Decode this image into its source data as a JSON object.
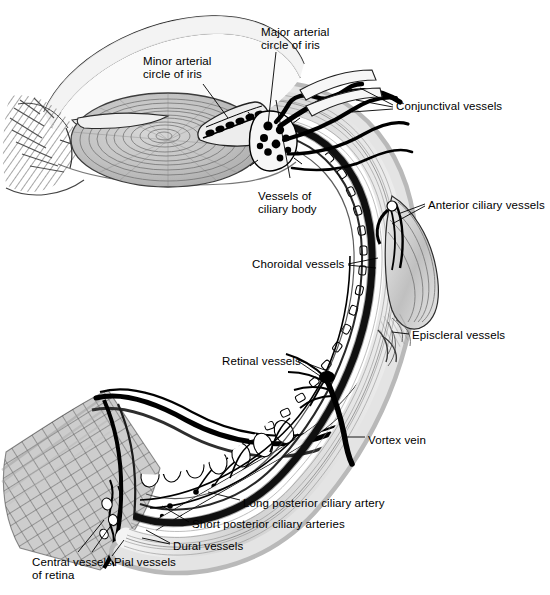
{
  "figure": {
    "type": "anatomical-diagram",
    "background_color": "#ffffff",
    "ink_color": "#000000",
    "width": 550,
    "height": 595
  },
  "labels": [
    {
      "id": "minor-arterial-circle-of-iris",
      "text": "Minor arterial\ncircle of iris",
      "x": 143,
      "y": 55,
      "align": "left"
    },
    {
      "id": "major-arterial-circle-of-iris",
      "text": "Major arterial\ncircle of iris",
      "x": 261,
      "y": 26,
      "align": "left"
    },
    {
      "id": "conjunctival-vessels",
      "text": "Conjunctival vessels",
      "x": 396,
      "y": 100,
      "align": "left"
    },
    {
      "id": "anterior-ciliary-vessels",
      "text": "Anterior ciliary vessels",
      "x": 428,
      "y": 199,
      "align": "left"
    },
    {
      "id": "vessels-of-ciliary-body",
      "text": "Vessels of\nciliary body",
      "x": 258,
      "y": 190,
      "align": "left"
    },
    {
      "id": "choroidal-vessels",
      "text": "Choroidal vessels",
      "x": 252,
      "y": 258,
      "align": "left"
    },
    {
      "id": "episcleral-vessels",
      "text": "Episcleral vessels",
      "x": 412,
      "y": 329,
      "align": "left"
    },
    {
      "id": "retinal-vessels",
      "text": "Retinal vessels",
      "x": 222,
      "y": 355,
      "align": "left"
    },
    {
      "id": "vortex-vein",
      "text": "Vortex vein",
      "x": 368,
      "y": 434,
      "align": "left"
    },
    {
      "id": "long-posterior-ciliary-artery",
      "text": "Long posterior ciliary artery",
      "x": 243,
      "y": 497,
      "align": "left"
    },
    {
      "id": "short-posterior-ciliary-arteries",
      "text": "Short posterior ciliary arteries",
      "x": 192,
      "y": 518,
      "align": "left"
    },
    {
      "id": "dural-vessels",
      "text": "Dural vessels",
      "x": 173,
      "y": 540,
      "align": "left"
    },
    {
      "id": "pial-vessels",
      "text": "Pial vessels",
      "x": 114,
      "y": 556,
      "align": "left"
    },
    {
      "id": "central-vessels-of-retina",
      "text": "Central vessels\nof retina",
      "x": 32,
      "y": 556,
      "align": "left"
    }
  ],
  "structures": [
    {
      "id": "cornea",
      "name": "Cornea"
    },
    {
      "id": "lens",
      "name": "Lens"
    },
    {
      "id": "iris",
      "name": "Iris"
    },
    {
      "id": "ciliary-body",
      "name": "Ciliary body"
    },
    {
      "id": "sclera",
      "name": "Sclera"
    },
    {
      "id": "choroid",
      "name": "Choroid"
    },
    {
      "id": "retina",
      "name": "Retina"
    },
    {
      "id": "optic-nerve",
      "name": "Optic nerve"
    },
    {
      "id": "extraocular-muscle-tendon",
      "name": "Extraocular muscle tendon"
    },
    {
      "id": "vitreous-chamber",
      "name": "Vitreous chamber"
    }
  ],
  "palette": {
    "ink": "#000000",
    "white": "#ffffff",
    "pale_grey": "#e9e9e9",
    "light_grey": "#d4d4d4",
    "mid_grey": "#b0b0b0",
    "dark_grey": "#757575",
    "deep_grey": "#3a3a3a"
  }
}
